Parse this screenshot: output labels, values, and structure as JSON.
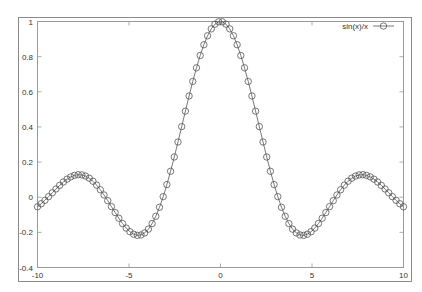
{
  "chart_data": {
    "type": "line",
    "title": "",
    "xlabel": "",
    "ylabel": "",
    "xlim": [
      -10,
      10
    ],
    "ylim": [
      -0.4,
      1
    ],
    "grid": false,
    "legend_position": "top-right",
    "x_ticks": [
      -10,
      -5,
      0,
      5,
      10
    ],
    "x_tick_labels": [
      "-10",
      "-5",
      "0",
      "5",
      "10"
    ],
    "y_ticks": [
      -0.4,
      -0.2,
      0,
      0.2,
      0.4,
      0.6,
      0.8,
      1
    ],
    "y_tick_labels": [
      "-0.4",
      "-0.2",
      "0",
      "0.2",
      "0.4",
      "0.6",
      "0.8",
      "1"
    ],
    "series": [
      {
        "name": "sin(x)/x",
        "function": "sin(x)/x",
        "samples": 100,
        "x_range": [
          -10,
          10
        ],
        "style": "linespoints",
        "marker": "open-circle",
        "color": "#555555",
        "key_points": [
          {
            "x": -10,
            "y": -0.054
          },
          {
            "x": -7.725,
            "y": 0.128
          },
          {
            "x": -4.493,
            "y": -0.217
          },
          {
            "x": 0,
            "y": 1.0
          },
          {
            "x": 4.493,
            "y": -0.217
          },
          {
            "x": 7.725,
            "y": 0.128
          },
          {
            "x": 10,
            "y": -0.054
          }
        ]
      }
    ]
  },
  "legend": {
    "label": "sin(x)/x"
  },
  "colors": {
    "frame": "#888888",
    "axis": "#999999",
    "series": "#555555",
    "background": "#ffffff"
  }
}
